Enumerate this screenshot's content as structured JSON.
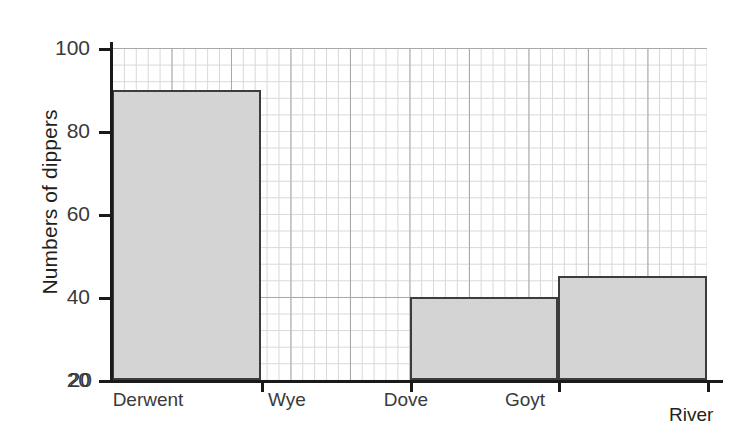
{
  "chart_data": {
    "type": "bar",
    "title": "",
    "xlabel": "River",
    "ylabel": "Numbers of dippers",
    "categories": [
      "Derwent",
      "Wye",
      "Dove",
      "Goyt"
    ],
    "values": [
      90,
      20,
      40,
      45
    ],
    "ylim": [
      20,
      100
    ],
    "y_ticks": [
      20,
      40,
      60,
      80,
      100
    ],
    "y_tick_labels": [
      "20",
      "40",
      "60",
      "80",
      "100"
    ],
    "grid": true,
    "grid_major_step": 20,
    "grid_minor_step": 5,
    "legend": "none",
    "bar_fill_color": "#d4d4d4",
    "bar_border_color": "#3c3c3c",
    "grid_major_color": "#a9a9a9",
    "grid_minor_color": "#d8d8d8",
    "axis_color": "#1a1a1a"
  },
  "axis": {
    "y_title": "Numbers of dippers",
    "x_title": "River"
  },
  "y_tick_labels": {
    "t100": "100",
    "t80": "80",
    "t60": "60",
    "t40": "40",
    "t20": "20",
    "baseline": "20"
  },
  "x_tick_labels": {
    "c0": "Derwent",
    "c1": "Wye",
    "c2": "Dove",
    "c3": "Goyt"
  }
}
